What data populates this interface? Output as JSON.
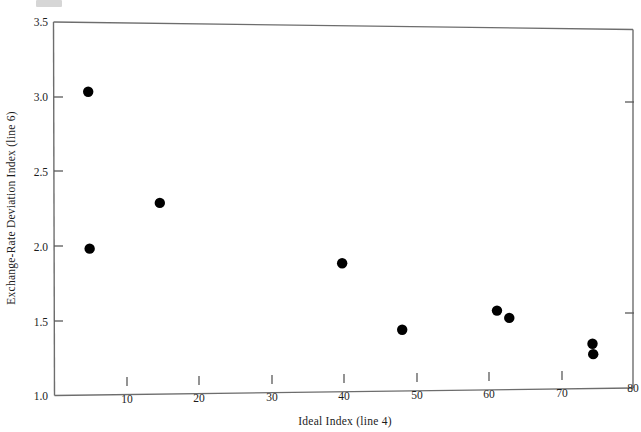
{
  "chart_data": {
    "type": "scatter",
    "title": "",
    "xlabel": "Ideal Index (line 4)",
    "ylabel": "Exchange-Rate Deviation Index (line 6)",
    "xlim": [
      0,
      80
    ],
    "ylim": [
      1.0,
      3.5
    ],
    "xticks": [
      10,
      20,
      30,
      40,
      50,
      60,
      70,
      80
    ],
    "xtick_labels": [
      "10",
      "20",
      "30",
      "40",
      "50",
      "60",
      "70",
      "80"
    ],
    "yticks": [
      1.0,
      1.5,
      2.0,
      2.5,
      3.0,
      3.5
    ],
    "ytick_labels": [
      "1.0",
      "1.5",
      "2.0",
      "2.5",
      "3.0",
      "3.5"
    ],
    "grid": false,
    "legend": null,
    "marker": "filled-circle",
    "marker_color": "#000000",
    "points": [
      {
        "x": 4.7,
        "y": 3.03
      },
      {
        "x": 4.9,
        "y": 1.98
      },
      {
        "x": 14.6,
        "y": 2.28
      },
      {
        "x": 39.8,
        "y": 1.86
      },
      {
        "x": 48.1,
        "y": 1.41
      },
      {
        "x": 61.2,
        "y": 1.53
      },
      {
        "x": 62.9,
        "y": 1.48
      },
      {
        "x": 74.4,
        "y": 1.3
      },
      {
        "x": 74.5,
        "y": 1.23
      }
    ]
  },
  "axes": {
    "x_axis_name": "Ideal Index (line 4)",
    "y_axis_name": "Exchange-Rate Deviation Index (line 6)"
  }
}
